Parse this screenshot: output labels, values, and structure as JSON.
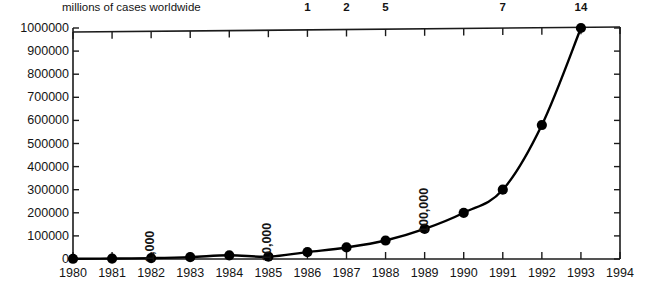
{
  "figure": {
    "title_fragment": "FIGURE 1. EST",
    "top_axis_label": "millions of cases worldwide"
  },
  "chart_data": {
    "type": "line",
    "title": "millions of cases worldwide",
    "xlabel": "",
    "ylabel": "",
    "grid": false,
    "legend": "none",
    "xlim": [
      1980,
      1994
    ],
    "ylim": [
      0,
      1000000
    ],
    "x": [
      1980,
      1981,
      1982,
      1983,
      1984,
      1985,
      1986,
      1987,
      1988,
      1989,
      1990,
      1991,
      1992,
      1993
    ],
    "values": [
      1000,
      2000,
      4000,
      8000,
      16000,
      10000,
      30000,
      50000,
      80000,
      130000,
      200000,
      300000,
      580000,
      1000000
    ],
    "marker": "circle",
    "line_color": "#000000",
    "marker_color": "#000000",
    "y_ticks": [
      0,
      100000,
      200000,
      300000,
      400000,
      500000,
      600000,
      700000,
      800000,
      900000,
      1000000
    ],
    "y_tick_labels": [
      "0",
      "100000",
      "200000",
      "300000",
      "400000",
      "500000",
      "600000",
      "700000",
      "800000",
      "900000",
      "1000000"
    ],
    "x_ticks": [
      1980,
      1981,
      1982,
      1983,
      1984,
      1985,
      1986,
      1987,
      1988,
      1989,
      1990,
      1991,
      1992,
      1993,
      1994
    ],
    "x_tick_labels": [
      "1980",
      "1981",
      "1982",
      "1983",
      "1984",
      "1985",
      "1986",
      "1987",
      "1988",
      "1989",
      "1990",
      "1991",
      "1992",
      "1993",
      "1994"
    ],
    "secondary_axis": {
      "position": "top",
      "label": "millions of cases worldwide",
      "ticks": [
        {
          "x": 1986,
          "label": "1"
        },
        {
          "x": 1987,
          "label": "2"
        },
        {
          "x": 1988,
          "label": "5"
        },
        {
          "x": 1991,
          "label": "7"
        },
        {
          "x": 1993,
          "label": "14"
        }
      ]
    },
    "annotations": [
      {
        "x": 1982,
        "label": "1,000",
        "rotation": -90
      },
      {
        "x": 1985,
        "label": "10,000",
        "rotation": -90
      },
      {
        "x": 1989,
        "label": "100,000",
        "rotation": -90
      }
    ]
  }
}
